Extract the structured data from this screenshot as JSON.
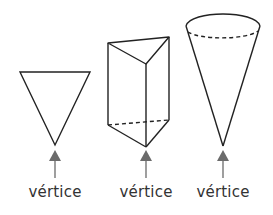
{
  "figure": {
    "colors": {
      "stroke": "#222222",
      "arrow": "#6b6b6b",
      "text": "#333333",
      "background": "#ffffff"
    },
    "shapes": [
      {
        "name": "triangle",
        "label": "vértice"
      },
      {
        "name": "triangular-prism",
        "label": "vértice"
      },
      {
        "name": "cone",
        "label": "vértice"
      }
    ]
  }
}
